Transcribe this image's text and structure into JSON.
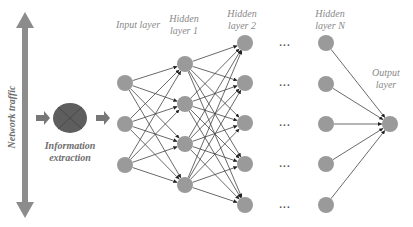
{
  "diagram": {
    "side_label": "Network traffic",
    "extraction_label": [
      "Information",
      "extraction"
    ],
    "layers": [
      {
        "name": "Input layer",
        "label_lines": [
          "Input layer"
        ],
        "x": 125,
        "nodes": [
          83,
          124,
          165
        ]
      },
      {
        "name": "Hidden layer 1",
        "label_lines": [
          "Hidden",
          "layer 1"
        ],
        "x": 185,
        "nodes": [
          64,
          104,
          144,
          185
        ]
      },
      {
        "name": "Hidden layer 2",
        "label_lines": [
          "Hidden",
          "layer 2"
        ],
        "x": 245,
        "nodes": [
          43,
          83,
          123,
          164,
          205
        ]
      },
      {
        "name": "Hidden layer N",
        "label_lines": [
          "Hidden",
          "layer N"
        ],
        "x": 326,
        "nodes": [
          43,
          84,
          124,
          164,
          205
        ]
      },
      {
        "name": "Output layer",
        "label_lines": [
          "Output",
          "layer"
        ],
        "x": 390,
        "nodes": [
          124
        ]
      }
    ],
    "ellipsis": "...",
    "colors": {
      "node": "#9a9a9a",
      "edge": "#444444",
      "arrow": "#8c8c8c",
      "ellipse": "#5e5e5e",
      "label": "#8a8a8a"
    }
  }
}
